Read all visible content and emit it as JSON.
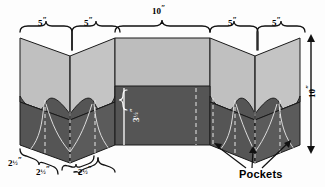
{
  "figure": {
    "background_color": "#fdfdfd",
    "panel_light_color": "#c0c0c0",
    "panel_dark_color": "#555555",
    "outline_color": "#1a1a1a",
    "dash_color": "#e8e8e8"
  },
  "dimensions": {
    "top_left_1": {
      "value": "5",
      "unit": "″"
    },
    "top_left_2": {
      "value": "5",
      "unit": "″"
    },
    "top_center": {
      "value": "10",
      "unit": "″"
    },
    "top_right_1": {
      "value": "5",
      "unit": "″"
    },
    "top_right_2": {
      "value": "5",
      "unit": "″"
    },
    "height_right": {
      "value": "10",
      "unit": "″"
    },
    "pocket_depth": {
      "whole": "3",
      "frac": "½",
      "unit": "″"
    },
    "bottom_1": {
      "whole": "2",
      "frac": "½",
      "unit": "″"
    },
    "bottom_2": {
      "whole": "2",
      "frac": "½",
      "unit": "″"
    },
    "bottom_3": {
      "whole": "2",
      "frac": "½",
      "unit": "″"
    }
  },
  "callouts": {
    "pockets_label": "Pockets"
  }
}
